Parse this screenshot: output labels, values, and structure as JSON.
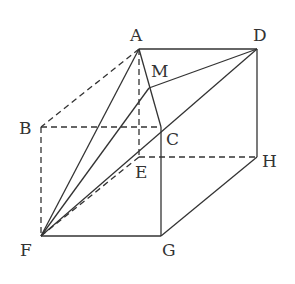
{
  "diagram": {
    "type": "geometry-cube",
    "stroke_color": "#333333",
    "background": "#ffffff",
    "points": {
      "A": {
        "label": "A",
        "x": 139,
        "y": 49
      },
      "B": {
        "label": "B",
        "x": 41,
        "y": 127
      },
      "C": {
        "label": "C",
        "x": 161,
        "y": 127
      },
      "D": {
        "label": "D",
        "x": 257,
        "y": 49
      },
      "E": {
        "label": "E",
        "x": 139,
        "y": 157
      },
      "F": {
        "label": "F",
        "x": 41,
        "y": 236
      },
      "G": {
        "label": "G",
        "x": 161,
        "y": 236
      },
      "H": {
        "label": "H",
        "x": 257,
        "y": 157
      },
      "M": {
        "label": "M",
        "x": 149,
        "y": 88
      }
    },
    "solid_edges": [
      [
        "A",
        "D"
      ],
      [
        "D",
        "H"
      ],
      [
        "H",
        "G"
      ],
      [
        "G",
        "F"
      ],
      [
        "C",
        "G"
      ],
      [
        "A",
        "C"
      ],
      [
        "A",
        "F"
      ],
      [
        "M",
        "F"
      ],
      [
        "M",
        "D"
      ],
      [
        "D",
        "F"
      ]
    ],
    "dashed_edges": [
      [
        "A",
        "B"
      ],
      [
        "B",
        "C"
      ],
      [
        "B",
        "F"
      ],
      [
        "A",
        "E"
      ],
      [
        "E",
        "H"
      ],
      [
        "E",
        "F"
      ]
    ]
  }
}
